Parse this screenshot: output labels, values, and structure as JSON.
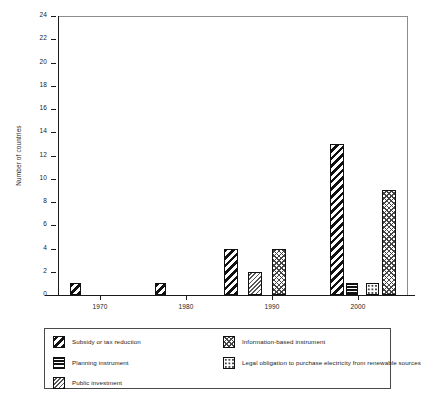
{
  "chart_data": {
    "type": "bar",
    "title": "",
    "xlabel": "",
    "ylabel": "Number of countries",
    "ylim": [
      0,
      24
    ],
    "yticks": [
      0,
      2,
      4,
      6,
      8,
      10,
      12,
      14,
      16,
      18,
      20,
      22,
      24
    ],
    "xticks": [
      "1970",
      "1980",
      "1990",
      "2000"
    ],
    "grid": false,
    "legend_position": "below-plot",
    "categories": [
      "1970",
      "1980",
      "1990",
      "2000"
    ],
    "series": [
      {
        "name": "Subsidy or tax reduction",
        "pattern": "diagonal-stripes",
        "values": [
          1,
          1,
          4,
          13
        ]
      },
      {
        "name": "Planning instrument",
        "pattern": "horizontal-stripes",
        "values": [
          0,
          0,
          0,
          1
        ]
      },
      {
        "name": "Public investment",
        "pattern": "fine-diagonal-hatch",
        "values": [
          0,
          0,
          2,
          0
        ]
      },
      {
        "name": "Information-based instrument",
        "pattern": "cross-hatch",
        "values": [
          0,
          0,
          4,
          9
        ]
      },
      {
        "name": "Legal obligation to purchase electricity from renewable sources",
        "pattern": "sparse-dots",
        "values": [
          0,
          0,
          0,
          1
        ]
      }
    ],
    "bars": [
      {
        "series": "Subsidy or tax reduction",
        "pattern": "p-subsidy",
        "x": 70,
        "width": 11,
        "value": 1
      },
      {
        "series": "Subsidy or tax reduction",
        "pattern": "p-subsidy",
        "x": 155,
        "width": 11,
        "value": 1
      },
      {
        "series": "Subsidy or tax reduction",
        "pattern": "p-subsidy",
        "x": 224,
        "width": 14,
        "value": 4
      },
      {
        "series": "Public investment",
        "pattern": "p-public",
        "x": 248,
        "width": 14,
        "value": 2
      },
      {
        "series": "Information-based instrument",
        "pattern": "p-info",
        "x": 272,
        "width": 14,
        "value": 4
      },
      {
        "series": "Subsidy or tax reduction",
        "pattern": "p-subsidy",
        "x": 330,
        "width": 14,
        "value": 13
      },
      {
        "series": "Planning instrument",
        "pattern": "p-planning",
        "x": 346,
        "width": 12,
        "value": 1
      },
      {
        "series": "Legal obligation to purchase electricity from renewable sources",
        "pattern": "p-legal",
        "x": 366,
        "width": 13,
        "value": 1
      },
      {
        "series": "Information-based instrument",
        "pattern": "p-info",
        "x": 382,
        "width": 14,
        "value": 9
      }
    ]
  },
  "legend": {
    "left_column": [
      {
        "label": "Subsidy or tax reduction",
        "pattern": "p-subsidy"
      },
      {
        "label": "Planning instrument",
        "pattern": "p-planning"
      },
      {
        "label": "Public investment",
        "pattern": "p-public"
      }
    ],
    "right_column": [
      {
        "label": "Information-based instrument",
        "pattern": "p-info"
      },
      {
        "label": "Legal obligation to purchase electricity from renewable sources",
        "pattern": "p-legal"
      }
    ]
  },
  "caption": ""
}
